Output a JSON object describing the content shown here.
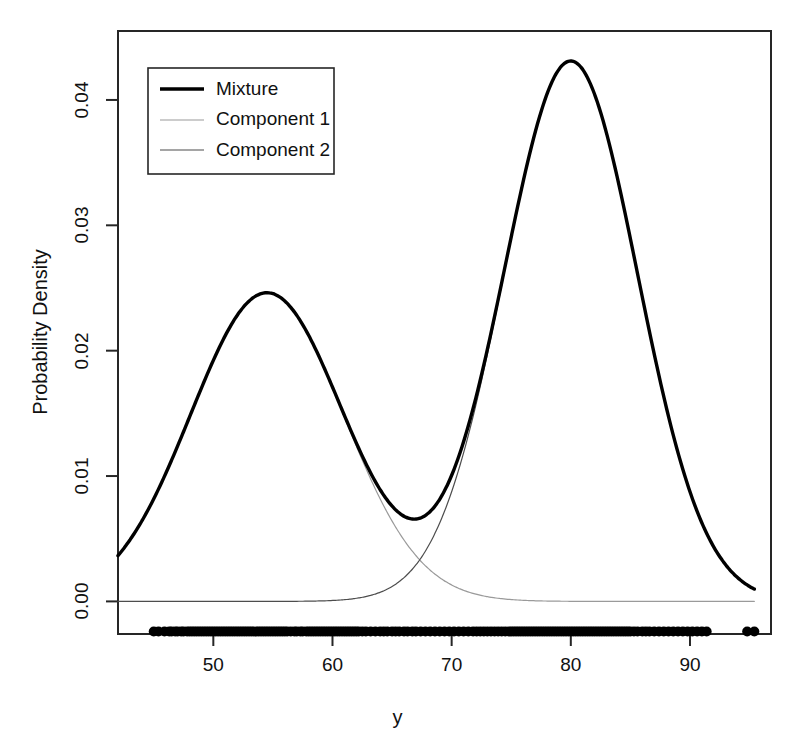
{
  "chart_data": {
    "type": "line",
    "title": "",
    "xlabel": "y",
    "ylabel": "Probability Density",
    "xlim": [
      42.0,
      96.8
    ],
    "ylim": [
      -0.0026,
      0.0455
    ],
    "xticks": [
      50,
      60,
      70,
      80,
      90
    ],
    "xtick_labels": [
      "50",
      "60",
      "70",
      "80",
      "90"
    ],
    "yticks": [
      0.0,
      0.01,
      0.02,
      0.03,
      0.04
    ],
    "ytick_labels": [
      "0.00",
      "0.01",
      "0.02",
      "0.03",
      "0.04"
    ],
    "grid": false,
    "legend_position": "top-left",
    "legend_entries": [
      "Mixture",
      "Component 1",
      "Component 2"
    ],
    "model": "two-component gaussian mixture",
    "components": [
      {
        "name": "Component 1",
        "mean": 54.5,
        "sd": 6.4,
        "weight": 0.395,
        "peak_density": 0.02465,
        "color": "#9a9a9a",
        "line_width": 1.2
      },
      {
        "name": "Component 2",
        "mean": 80.0,
        "sd": 5.6,
        "weight": 0.605,
        "peak_density": 0.0431,
        "color": "#4d4d4d",
        "line_width": 1.2
      }
    ],
    "mixture": {
      "name": "Mixture",
      "color": "#000000",
      "line_width": 3.4,
      "peaks": [
        {
          "x": 54.5,
          "y": 0.02455
        },
        {
          "x": 80.0,
          "y": 0.0432
        }
      ],
      "valley": {
        "x": 66.9,
        "y": 0.00625
      },
      "endpoints": [
        {
          "x": 42.0,
          "y": 0.00345
        },
        {
          "x": 95.4,
          "y": 0.00095
        }
      ]
    },
    "series": [
      {
        "name": "Mixture",
        "color": "#000000",
        "x": [
          42.0,
          43.5,
          45.0,
          46.5,
          48.0,
          49.5,
          51.0,
          52.5,
          54.0,
          54.5,
          55.5,
          57.0,
          58.5,
          60.0,
          61.5,
          63.0,
          64.5,
          66.0,
          66.9,
          68.0,
          69.5,
          71.0,
          72.5,
          74.0,
          75.5,
          77.0,
          78.5,
          80.0,
          81.5,
          83.0,
          84.5,
          86.0,
          87.5,
          89.0,
          90.5,
          92.0,
          93.5,
          95.4
        ],
        "y": [
          0.00345,
          0.00524,
          0.00759,
          0.01045,
          0.01368,
          0.01703,
          0.02014,
          0.02263,
          0.02418,
          0.02455,
          0.02453,
          0.02354,
          0.0215,
          0.01867,
          0.01546,
          0.01232,
          0.00964,
          0.0076,
          0.00625,
          0.00736,
          0.01118,
          0.01742,
          0.0252,
          0.03301,
          0.03918,
          0.04248,
          0.04318,
          0.0432,
          0.04146,
          0.03658,
          0.02955,
          0.02166,
          0.01419,
          0.00824,
          0.00424,
          0.00195,
          0.00083,
          0.00095
        ]
      },
      {
        "name": "Component 1",
        "color": "#9a9a9a",
        "x": [
          42.0,
          44.0,
          46.0,
          48.0,
          50.0,
          52.0,
          54.5,
          57.0,
          59.0,
          61.0,
          63.0,
          65.0,
          67.0,
          69.0,
          71.0,
          73.0,
          75.0,
          78.0,
          82.0,
          88.0,
          95.4
        ],
        "y": [
          0.00345,
          0.00612,
          0.00983,
          0.01441,
          0.0193,
          0.02302,
          0.02465,
          0.02309,
          0.01989,
          0.01584,
          0.01157,
          0.00774,
          0.00475,
          0.00267,
          0.00137,
          0.00064,
          0.00028,
          6e-05,
          1e-05,
          0.0,
          0.0
        ]
      },
      {
        "name": "Component 2",
        "color": "#4d4d4d",
        "x": [
          42.0,
          52.0,
          58.0,
          61.0,
          63.0,
          65.0,
          67.0,
          69.0,
          71.0,
          73.0,
          75.0,
          77.0,
          80.0,
          83.0,
          85.0,
          87.0,
          89.0,
          91.0,
          93.0,
          95.4
        ],
        "y": [
          0.0,
          0.0,
          2e-05,
          0.00013,
          0.00043,
          0.00125,
          0.00323,
          0.00745,
          0.01537,
          0.02835,
          0.0402,
          0.0424,
          0.0431,
          0.03657,
          0.02817,
          0.01883,
          0.01107,
          0.00572,
          0.00254,
          0.00093
        ]
      }
    ],
    "rug": {
      "description": "observed data points plotted as filled circles below axis",
      "y_position": -0.0024,
      "marker": "filled-circle",
      "color": "#000000",
      "count": 260,
      "x_values": [
        45.0,
        45.4,
        45.9,
        46.3,
        46.5,
        46.8,
        47.0,
        47.3,
        47.5,
        47.8,
        48.0,
        48.2,
        48.4,
        48.6,
        48.8,
        49.0,
        49.2,
        49.4,
        49.6,
        49.8,
        50.0,
        50.2,
        50.4,
        50.6,
        50.8,
        51.0,
        51.2,
        51.4,
        51.6,
        51.8,
        52.0,
        52.2,
        52.4,
        52.6,
        52.8,
        53.0,
        53.2,
        53.4,
        53.6,
        53.8,
        54.0,
        54.2,
        54.4,
        54.6,
        54.8,
        55.0,
        55.2,
        55.4,
        55.6,
        55.8,
        56.0,
        56.2,
        56.5,
        56.8,
        57.0,
        57.3,
        57.5,
        57.8,
        58.0,
        58.2,
        58.4,
        58.6,
        58.8,
        59.0,
        59.2,
        59.4,
        59.6,
        59.8,
        60.0,
        60.2,
        60.4,
        60.6,
        60.8,
        61.0,
        61.2,
        61.4,
        61.6,
        61.8,
        62.0,
        62.2,
        62.5,
        62.8,
        63.2,
        63.6,
        64.0,
        64.3,
        64.6,
        65.0,
        65.3,
        65.6,
        66.0,
        66.3,
        66.7,
        67.0,
        67.4,
        67.8,
        68.2,
        68.6,
        69.0,
        69.4,
        69.8,
        70.2,
        70.6,
        71.0,
        71.4,
        71.8,
        72.1,
        72.4,
        72.7,
        73.0,
        73.3,
        73.6,
        73.9,
        74.2,
        74.5,
        74.8,
        75.0,
        75.2,
        75.4,
        75.6,
        75.8,
        76.0,
        76.2,
        76.4,
        76.6,
        76.8,
        77.0,
        77.2,
        77.4,
        77.6,
        77.8,
        78.0,
        78.2,
        78.4,
        78.6,
        78.8,
        79.0,
        79.2,
        79.4,
        79.6,
        79.8,
        80.0,
        80.2,
        80.4,
        80.6,
        80.8,
        81.0,
        81.2,
        81.4,
        81.6,
        81.8,
        82.0,
        82.2,
        82.4,
        82.6,
        82.8,
        83.0,
        83.2,
        83.4,
        83.6,
        83.8,
        84.0,
        84.2,
        84.4,
        84.6,
        84.8,
        85.0,
        85.3,
        85.6,
        86.0,
        86.3,
        86.6,
        87.0,
        87.4,
        87.8,
        88.2,
        88.6,
        89.0,
        89.4,
        89.8,
        90.2,
        90.6,
        91.0,
        91.4,
        94.8,
        95.4
      ]
    }
  },
  "axes": {
    "ylabel_text": "Probability Density",
    "xlabel_text": "y"
  }
}
